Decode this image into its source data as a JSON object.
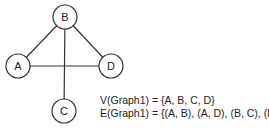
{
  "graph": {
    "nodes": [
      {
        "id": "A",
        "label": "A",
        "cx": 18,
        "cy": 66
      },
      {
        "id": "B",
        "label": "B",
        "cx": 65,
        "cy": 17
      },
      {
        "id": "C",
        "label": "C",
        "cx": 64,
        "cy": 111
      },
      {
        "id": "D",
        "label": "D",
        "cx": 111,
        "cy": 66
      }
    ],
    "edges": [
      [
        "A",
        "B"
      ],
      [
        "A",
        "D"
      ],
      [
        "B",
        "C"
      ],
      [
        "B",
        "D"
      ]
    ],
    "stroke_color": "#333333"
  },
  "sets": {
    "vertices": "V(Graph1) = {A, B, C, D}",
    "edges": "E(Graph1) = {(A, B), (A, D), (B, C), (B, D)}"
  }
}
